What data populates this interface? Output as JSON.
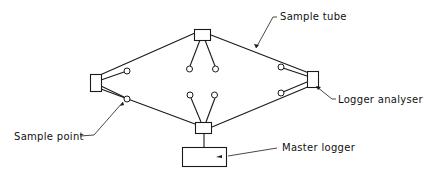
{
  "diagram": {
    "type": "network-schematic",
    "labels": {
      "sample_tube": "Sample tube",
      "logger_analyser": "Logger analyser",
      "sample_point": "Sample point",
      "master_logger": "Master logger"
    },
    "nodes": [
      {
        "id": "top-analyser",
        "kind": "logger-analyser",
        "sample_points": 2
      },
      {
        "id": "left-analyser",
        "kind": "logger-analyser",
        "sample_points": 2
      },
      {
        "id": "right-analyser",
        "kind": "logger-analyser",
        "sample_points": 2
      },
      {
        "id": "bottom-analyser",
        "kind": "logger-analyser",
        "sample_points": 2
      },
      {
        "id": "master-logger",
        "kind": "master-logger"
      }
    ],
    "connections": [
      [
        "left-analyser",
        "top-analyser"
      ],
      [
        "top-analyser",
        "right-analyser"
      ],
      [
        "right-analyser",
        "bottom-analyser"
      ],
      [
        "bottom-analyser",
        "left-analyser"
      ],
      [
        "bottom-analyser",
        "master-logger"
      ]
    ]
  }
}
